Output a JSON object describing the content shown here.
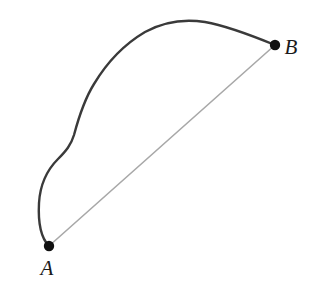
{
  "figure": {
    "width": 313,
    "height": 289,
    "background_color": "#ffffff"
  },
  "colors": {
    "curve": "#3a3a3a",
    "chord": "#a8a8a8",
    "point": "#111111",
    "label": "#1a1a1a"
  },
  "points": {
    "a": {
      "label": "A",
      "x": 49,
      "y": 246,
      "radius": 5.2,
      "label_x": 47,
      "label_y": 275
    },
    "b": {
      "label": "B",
      "x": 275,
      "y": 45,
      "radius": 5.2,
      "label_x": 291,
      "label_y": 54
    }
  },
  "chart_data": {
    "type": "line",
    "xlabel": "",
    "ylabel": "",
    "xlim": [
      0,
      313
    ],
    "ylim": [
      289,
      0
    ],
    "grid": false,
    "legend": "none",
    "annotations": [
      "A",
      "B"
    ],
    "series": [
      {
        "name": "curved-path",
        "style": "solid",
        "color": "#3a3a3a",
        "width": 2.4,
        "x": [
          49,
          45,
          41,
          39,
          40,
          44,
          50,
          57,
          63,
          68,
          71,
          75,
          80,
          86,
          93,
          101,
          110,
          120,
          131,
          143,
          156,
          169,
          182,
          195,
          208,
          221,
          234,
          248,
          261,
          275
        ],
        "y": [
          246,
          232,
          216,
          200,
          186,
          173,
          163,
          155,
          149,
          143,
          137,
          129,
          118,
          104,
          90,
          76,
          62,
          51,
          41,
          33,
          27,
          23,
          21,
          21,
          22,
          25,
          29,
          34,
          39,
          45
        ]
      },
      {
        "name": "straight-chord",
        "style": "solid",
        "color": "#a8a8a8",
        "width": 1.6,
        "x": [
          49,
          275
        ],
        "y": [
          246,
          45
        ]
      }
    ]
  },
  "paths": {
    "curve_d": "M 49 246 C 41 238 38 222 39 203 C 40 186 47 170 58 159 C 66 151 71 145 74 135 C 78 120 84 100 94 84 C 106 64 123 45 145 32 C 165 21 186 19 205 22 C 228 26 253 36 275 45",
    "chord_d": "M 49 246 L 275 45"
  }
}
